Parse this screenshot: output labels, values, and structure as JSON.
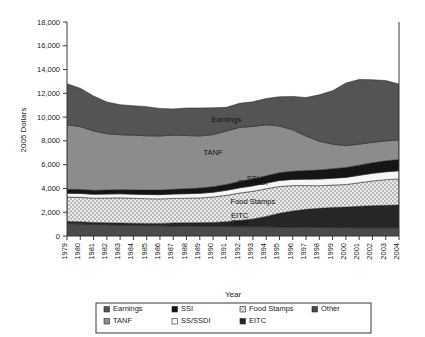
{
  "chart_data": {
    "type": "area",
    "title": "",
    "subtitle": "",
    "xlabel": "Year",
    "ylabel": "2005 Dollars",
    "ylim": [
      0,
      18000
    ],
    "ytick_labels": [
      "0",
      "2,000",
      "4,000",
      "6,000",
      "8,000",
      "10,000",
      "12,000",
      "14,000",
      "16,000",
      "18,000"
    ],
    "ytick_values": [
      0,
      2000,
      4000,
      6000,
      8000,
      10000,
      12000,
      14000,
      16000,
      18000
    ],
    "grid": false,
    "stacked": true,
    "legend_position": "bottom",
    "x": [
      1979,
      1980,
      1981,
      1982,
      1983,
      1984,
      1985,
      1986,
      1987,
      1988,
      1989,
      1990,
      1991,
      1992,
      1993,
      1994,
      1995,
      1996,
      1997,
      1998,
      1999,
      2000,
      2001,
      2002,
      2003,
      2004
    ],
    "categories": [
      "1979",
      "1980",
      "1981",
      "1982",
      "1983",
      "1984",
      "1985",
      "1986",
      "1987",
      "1988",
      "1989",
      "1990",
      "1991",
      "1992",
      "1993",
      "1994",
      "1995",
      "1996",
      "1997",
      "1998",
      "1999",
      "2000",
      "2001",
      "2002",
      "2003",
      "2004"
    ],
    "stack_order_bottom_to_top": [
      "Other",
      "EITC",
      "Food Stamps",
      "SS/SSDI",
      "SSI",
      "TANF",
      "Earnings"
    ],
    "series": [
      {
        "name": "Other",
        "color": "#4a4a4a",
        "pattern": "solid-dark",
        "values": [
          1050,
          1020,
          980,
          950,
          930,
          900,
          880,
          860,
          840,
          830,
          820,
          810,
          800,
          790,
          780,
          770,
          760,
          750,
          740,
          730,
          720,
          710,
          700,
          700,
          700,
          700
        ]
      },
      {
        "name": "EITC",
        "color": "#262626",
        "pattern": "solid-black",
        "values": [
          170,
          170,
          160,
          160,
          160,
          170,
          180,
          200,
          260,
          280,
          300,
          330,
          400,
          520,
          640,
          880,
          1150,
          1350,
          1500,
          1600,
          1680,
          1720,
          1800,
          1850,
          1880,
          1900
        ]
      },
      {
        "name": "Food Stamps",
        "color": "#ececec",
        "pattern": "dotted",
        "values": [
          2050,
          2060,
          2040,
          2080,
          2120,
          2100,
          2080,
          2060,
          2060,
          2070,
          2080,
          2140,
          2220,
          2300,
          2340,
          2320,
          2260,
          2140,
          2000,
          1900,
          1880,
          1900,
          1980,
          2080,
          2160,
          2200
        ]
      },
      {
        "name": "SS/SSDI",
        "color": "#f7f7f7",
        "pattern": "white",
        "values": [
          330,
          330,
          330,
          340,
          340,
          350,
          350,
          360,
          370,
          380,
          390,
          400,
          420,
          440,
          460,
          480,
          500,
          520,
          540,
          560,
          580,
          600,
          620,
          640,
          660,
          680
        ]
      },
      {
        "name": "SSI",
        "color": "#151515",
        "pattern": "solid-black",
        "values": [
          330,
          330,
          330,
          340,
          350,
          360,
          370,
          380,
          400,
          420,
          440,
          470,
          500,
          540,
          580,
          620,
          660,
          690,
          720,
          760,
          800,
          830,
          860,
          890,
          920,
          950
        ]
      },
      {
        "name": "TANF",
        "color": "#8c8c8c",
        "pattern": "solid-gray",
        "values": [
          5430,
          5290,
          5000,
          4730,
          4620,
          4600,
          4570,
          4550,
          4560,
          4470,
          4380,
          4380,
          4480,
          4540,
          4420,
          4280,
          3920,
          3480,
          2900,
          2420,
          2060,
          1840,
          1760,
          1720,
          1680,
          1640
        ]
      },
      {
        "name": "Earnings",
        "color": "#545454",
        "pattern": "solid-darkgray",
        "values": [
          3440,
          3230,
          2940,
          2680,
          2520,
          2480,
          2450,
          2320,
          2200,
          2320,
          2360,
          2250,
          2000,
          2040,
          2070,
          2220,
          2460,
          2810,
          3250,
          3910,
          4500,
          5260,
          5450,
          5260,
          5080,
          4710
        ]
      }
    ],
    "inchart_labels": [
      {
        "text": "Earnings",
        "x": 1991,
        "y": 9600
      },
      {
        "text": "TANF",
        "x": 1990,
        "y": 6850
      },
      {
        "text": "SSI",
        "x": 1993,
        "y": 4620
      },
      {
        "text": "SS/SSDI",
        "x": 1993,
        "y": 4300
      },
      {
        "text": "Food Stamps",
        "x": 1993,
        "y": 2700
      },
      {
        "text": "EITC",
        "x": 1992,
        "y": 1500
      },
      {
        "text": "Other",
        "x": 1992,
        "y": 900
      }
    ],
    "legend": [
      {
        "label": "Earnings",
        "color": "#545454",
        "pattern": "solid-darkgray"
      },
      {
        "label": "SSI",
        "color": "#151515",
        "pattern": "solid-black"
      },
      {
        "label": "Food Stamps",
        "color": "#ececec",
        "pattern": "dotted"
      },
      {
        "label": "Other",
        "color": "#4a4a4a",
        "pattern": "solid-dark"
      },
      {
        "label": "TANF",
        "color": "#8c8c8c",
        "pattern": "solid-gray"
      },
      {
        "label": "SS/SSDI",
        "color": "#f7f7f7",
        "pattern": "white"
      },
      {
        "label": "EITC",
        "color": "#262626",
        "pattern": "solid-black"
      }
    ]
  }
}
